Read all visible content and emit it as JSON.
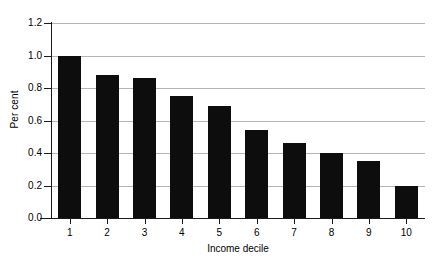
{
  "chart_data": {
    "type": "bar",
    "title": "",
    "xlabel": "Income decile",
    "ylabel": "Per cent",
    "categories": [
      "1",
      "2",
      "3",
      "4",
      "5",
      "6",
      "7",
      "8",
      "9",
      "10"
    ],
    "values": [
      1.0,
      0.88,
      0.86,
      0.75,
      0.69,
      0.54,
      0.46,
      0.4,
      0.35,
      0.2
    ],
    "ylim": [
      0.0,
      1.2
    ],
    "ytick_labels": [
      "0.0",
      "0.2",
      "0.4",
      "0.6",
      "0.8",
      "1.0",
      "1.2"
    ],
    "ytick_values": [
      0.0,
      0.2,
      0.4,
      0.6,
      0.8,
      1.0,
      1.2
    ],
    "grid": true,
    "legend": false,
    "bar_color": "#0d0d0d",
    "grid_color": "#b5b5b5",
    "axis_color": "#1a1a1a",
    "background_color": "#ffffff"
  }
}
